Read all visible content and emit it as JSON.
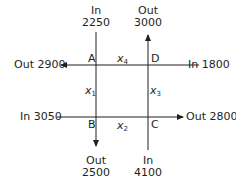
{
  "colors": {
    "line": "#231f20",
    "text": "#231f20",
    "background": "#ffffff"
  },
  "nodes": {
    "A": "A",
    "B": "B",
    "C": "C",
    "D": "D"
  },
  "variables": {
    "x1": {
      "base": "x",
      "sub": "1"
    },
    "x2": {
      "base": "x",
      "sub": "2"
    },
    "x3": {
      "base": "x",
      "sub": "3"
    },
    "x4": {
      "base": "x",
      "sub": "4"
    }
  },
  "flows": {
    "top_A": {
      "direction": "In",
      "value": "2250"
    },
    "top_D": {
      "direction": "Out",
      "value": "3000"
    },
    "left_A": {
      "label": "Out 2900",
      "direction": "Out",
      "value": "2900"
    },
    "right_D": {
      "label": "In 1800",
      "direction": "In",
      "value": "1800"
    },
    "left_B": {
      "label": "In 3050",
      "direction": "In",
      "value": "3050"
    },
    "right_C": {
      "label": "Out 2800",
      "direction": "Out",
      "value": "2800"
    },
    "bottom_B": {
      "direction": "Out",
      "value": "2500"
    },
    "bottom_C": {
      "direction": "In",
      "value": "4100"
    }
  }
}
